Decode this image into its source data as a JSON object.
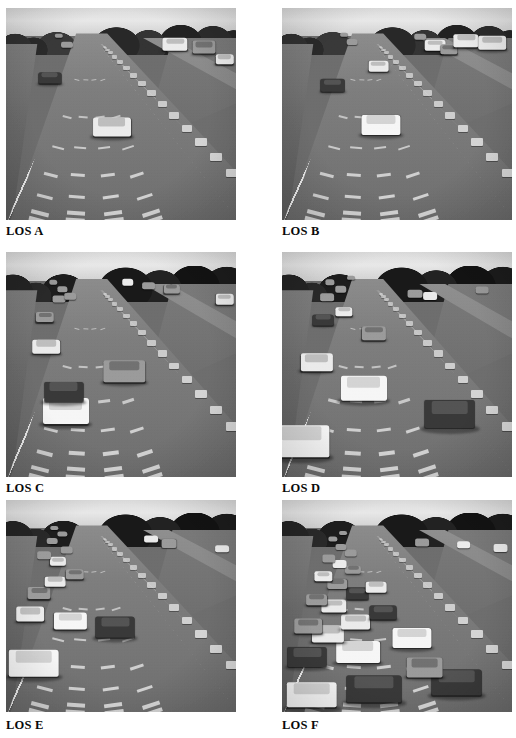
{
  "figure": {
    "layout": {
      "columns": 2,
      "rows": 3,
      "page_width": 516,
      "page_height": 738
    },
    "background_color": "#ffffff",
    "caption_color": "#0a0a0a"
  },
  "panels": [
    {
      "id": "los-a",
      "caption": "LOS A",
      "position": {
        "x": 6,
        "y": 8,
        "width": 230,
        "height": 212
      },
      "caption_position": {
        "x": 6,
        "y": 224
      },
      "scene": "four-lane freeway viewed from overpass, free-flow traffic",
      "density_label": "free flow",
      "vehicle_count": 7,
      "vehicles": [
        {
          "lane": 3,
          "x": 46.0,
          "y": 56.0,
          "w": 16.5,
          "h": 9.0,
          "tone": "light",
          "far": false
        },
        {
          "lane": 2,
          "x": 19.0,
          "y": 33.0,
          "w": 10.0,
          "h": 5.4,
          "tone": "dark",
          "far": false
        },
        {
          "lane": 2,
          "x": 26.5,
          "y": 17.5,
          "w": 5.2,
          "h": 3.0,
          "tone": "mid",
          "far": true
        },
        {
          "lane": 2,
          "x": 23.0,
          "y": 13.0,
          "w": 3.6,
          "h": 2.2,
          "tone": "mid",
          "far": true
        },
        {
          "lane": 9,
          "x": 73.5,
          "y": 17.0,
          "w": 11.0,
          "h": 6.0,
          "tone": "light",
          "far": false
        },
        {
          "lane": 9,
          "x": 86.0,
          "y": 18.5,
          "w": 10.0,
          "h": 6.2,
          "tone": "mid",
          "far": false
        },
        {
          "lane": 9,
          "x": 95.0,
          "y": 24.0,
          "w": 8.0,
          "h": 4.6,
          "tone": "light",
          "far": false
        }
      ]
    },
    {
      "id": "los-b",
      "caption": "LOS B",
      "position": {
        "x": 282,
        "y": 8,
        "width": 230,
        "height": 212
      },
      "caption_position": {
        "x": 282,
        "y": 224
      },
      "scene": "four-lane freeway, reasonably free flow",
      "density_label": "reasonably free flow",
      "vehicle_count": 10,
      "vehicles": [
        {
          "lane": 3,
          "x": 43.0,
          "y": 55.0,
          "w": 17.0,
          "h": 9.5,
          "tone": "white",
          "far": false
        },
        {
          "lane": 3,
          "x": 42.0,
          "y": 27.5,
          "w": 9.0,
          "h": 5.0,
          "tone": "light",
          "far": false
        },
        {
          "lane": 1,
          "x": 22.0,
          "y": 36.5,
          "w": 10.5,
          "h": 5.8,
          "tone": "dark",
          "far": false
        },
        {
          "lane": 2,
          "x": 30.5,
          "y": 16.0,
          "w": 4.6,
          "h": 2.8,
          "tone": "mid",
          "far": true
        },
        {
          "lane": 2,
          "x": 27.0,
          "y": 12.5,
          "w": 3.4,
          "h": 2.2,
          "tone": "mid",
          "far": true
        },
        {
          "lane": 8,
          "x": 66.5,
          "y": 17.5,
          "w": 9.0,
          "h": 5.0,
          "tone": "light",
          "far": false
        },
        {
          "lane": 9,
          "x": 72.5,
          "y": 19.5,
          "w": 7.5,
          "h": 4.4,
          "tone": "mid",
          "far": false
        },
        {
          "lane": 9,
          "x": 80.0,
          "y": 15.5,
          "w": 11.0,
          "h": 6.4,
          "tone": "light",
          "far": false
        },
        {
          "lane": 9,
          "x": 91.5,
          "y": 16.5,
          "w": 12.0,
          "h": 6.8,
          "tone": "light",
          "far": false
        },
        {
          "lane": 9,
          "x": 60.0,
          "y": 13.5,
          "w": 5.0,
          "h": 3.0,
          "tone": "mid",
          "far": true
        }
      ]
    },
    {
      "id": "los-c",
      "caption": "LOS C",
      "position": {
        "x": 6,
        "y": 252,
        "width": 230,
        "height": 225
      },
      "caption_position": {
        "x": 6,
        "y": 481
      },
      "scene": "four-lane freeway, stable flow with restricted maneuvering",
      "density_label": "stable flow",
      "vehicle_count": 13,
      "vehicles": [
        {
          "lane": 2,
          "x": 26.0,
          "y": 70.5,
          "w": 20.0,
          "h": 11.5,
          "tone": "white",
          "far": false
        },
        {
          "lane": 2,
          "x": 25.0,
          "y": 62.0,
          "w": 17.0,
          "h": 9.0,
          "tone": "dark",
          "far": false
        },
        {
          "lane": 5,
          "x": 51.5,
          "y": 53.0,
          "w": 18.0,
          "h": 9.5,
          "tone": "mid",
          "far": false
        },
        {
          "lane": 1,
          "x": 17.5,
          "y": 42.0,
          "w": 12.0,
          "h": 6.5,
          "tone": "light",
          "far": false
        },
        {
          "lane": 1,
          "x": 17.0,
          "y": 29.0,
          "w": 8.0,
          "h": 4.4,
          "tone": "mid",
          "far": false
        },
        {
          "lane": 2,
          "x": 23.0,
          "y": 21.0,
          "w": 5.6,
          "h": 3.2,
          "tone": "mid",
          "far": true
        },
        {
          "lane": 2,
          "x": 28.0,
          "y": 19.5,
          "w": 5.0,
          "h": 3.0,
          "tone": "mid",
          "far": true
        },
        {
          "lane": 2,
          "x": 24.5,
          "y": 16.5,
          "w": 4.0,
          "h": 2.4,
          "tone": "mid",
          "far": true
        },
        {
          "lane": 2,
          "x": 20.5,
          "y": 13.5,
          "w": 3.2,
          "h": 2.0,
          "tone": "mid",
          "far": true
        },
        {
          "lane": 8,
          "x": 53.0,
          "y": 13.5,
          "w": 5.0,
          "h": 3.0,
          "tone": "light",
          "far": true
        },
        {
          "lane": 9,
          "x": 62.0,
          "y": 15.0,
          "w": 6.0,
          "h": 3.4,
          "tone": "mid",
          "far": true
        },
        {
          "lane": 9,
          "x": 72.0,
          "y": 16.5,
          "w": 7.0,
          "h": 4.0,
          "tone": "mid",
          "far": false
        },
        {
          "lane": 9,
          "x": 95.0,
          "y": 21.0,
          "w": 8.0,
          "h": 4.6,
          "tone": "light",
          "far": false
        }
      ]
    },
    {
      "id": "los-d",
      "caption": "LOS D",
      "position": {
        "x": 282,
        "y": 252,
        "width": 230,
        "height": 225
      },
      "caption_position": {
        "x": 282,
        "y": 481
      },
      "scene": "four-lane freeway, approaching unstable flow",
      "density_label": "approaching unstable flow",
      "vehicle_count": 14,
      "vehicles": [
        {
          "lane": 1,
          "x": 8.5,
          "y": 84.0,
          "w": 24.0,
          "h": 14.0,
          "tone": "white",
          "far": false
        },
        {
          "lane": 6,
          "x": 73.0,
          "y": 72.0,
          "w": 22.0,
          "h": 12.5,
          "tone": "dark",
          "far": false
        },
        {
          "lane": 3,
          "x": 35.5,
          "y": 60.5,
          "w": 20.0,
          "h": 11.0,
          "tone": "white",
          "far": false
        },
        {
          "lane": 1,
          "x": 15.0,
          "y": 49.0,
          "w": 14.0,
          "h": 7.8,
          "tone": "light",
          "far": false
        },
        {
          "lane": 4,
          "x": 40.0,
          "y": 36.0,
          "w": 10.5,
          "h": 6.0,
          "tone": "mid",
          "far": false
        },
        {
          "lane": 2,
          "x": 18.0,
          "y": 30.0,
          "w": 9.0,
          "h": 5.0,
          "tone": "dark",
          "far": false
        },
        {
          "lane": 2,
          "x": 27.0,
          "y": 26.5,
          "w": 7.5,
          "h": 4.2,
          "tone": "light",
          "far": false
        },
        {
          "lane": 1,
          "x": 19.5,
          "y": 20.0,
          "w": 6.0,
          "h": 3.4,
          "tone": "mid",
          "far": true
        },
        {
          "lane": 2,
          "x": 25.5,
          "y": 16.5,
          "w": 5.0,
          "h": 3.0,
          "tone": "mid",
          "far": true
        },
        {
          "lane": 2,
          "x": 21.0,
          "y": 13.5,
          "w": 4.0,
          "h": 2.4,
          "tone": "mid",
          "far": true
        },
        {
          "lane": 2,
          "x": 30.0,
          "y": 11.5,
          "w": 3.4,
          "h": 2.0,
          "tone": "mid",
          "far": true
        },
        {
          "lane": 8,
          "x": 58.0,
          "y": 18.5,
          "w": 6.5,
          "h": 3.8,
          "tone": "mid",
          "far": true
        },
        {
          "lane": 9,
          "x": 64.5,
          "y": 19.5,
          "w": 6.0,
          "h": 3.6,
          "tone": "light",
          "far": true
        },
        {
          "lane": 9,
          "x": 87.0,
          "y": 17.0,
          "w": 5.5,
          "h": 3.2,
          "tone": "mid",
          "far": true
        }
      ]
    },
    {
      "id": "los-e",
      "caption": "LOS E",
      "position": {
        "x": 6,
        "y": 500,
        "width": 230,
        "height": 212
      },
      "caption_position": {
        "x": 6,
        "y": 718
      },
      "scene": "four-lane freeway at capacity, unstable flow",
      "density_label": "at capacity",
      "vehicle_count": 16,
      "vehicles": [
        {
          "lane": 1,
          "x": 12.0,
          "y": 77.0,
          "w": 22.0,
          "h": 12.5,
          "tone": "white",
          "far": false
        },
        {
          "lane": 4,
          "x": 47.5,
          "y": 60.0,
          "w": 17.0,
          "h": 10.0,
          "tone": "dark",
          "far": false
        },
        {
          "lane": 3,
          "x": 28.0,
          "y": 57.0,
          "w": 14.0,
          "h": 8.0,
          "tone": "white",
          "far": false
        },
        {
          "lane": 1,
          "x": 10.5,
          "y": 54.0,
          "w": 12.0,
          "h": 7.0,
          "tone": "light",
          "far": false
        },
        {
          "lane": 1,
          "x": 14.5,
          "y": 44.0,
          "w": 10.0,
          "h": 5.6,
          "tone": "mid",
          "far": false
        },
        {
          "lane": 2,
          "x": 21.5,
          "y": 38.5,
          "w": 9.0,
          "h": 5.0,
          "tone": "light",
          "far": false
        },
        {
          "lane": 3,
          "x": 30.0,
          "y": 35.0,
          "w": 8.0,
          "h": 4.6,
          "tone": "mid",
          "far": false
        },
        {
          "lane": 2,
          "x": 22.5,
          "y": 29.0,
          "w": 7.0,
          "h": 4.0,
          "tone": "light",
          "far": false
        },
        {
          "lane": 1,
          "x": 16.5,
          "y": 26.0,
          "w": 6.0,
          "h": 3.6,
          "tone": "mid",
          "far": true
        },
        {
          "lane": 2,
          "x": 26.5,
          "y": 23.5,
          "w": 5.4,
          "h": 3.2,
          "tone": "mid",
          "far": true
        },
        {
          "lane": 2,
          "x": 20.0,
          "y": 19.5,
          "w": 4.6,
          "h": 2.8,
          "tone": "mid",
          "far": true
        },
        {
          "lane": 2,
          "x": 24.5,
          "y": 16.0,
          "w": 4.0,
          "h": 2.4,
          "tone": "mid",
          "far": true
        },
        {
          "lane": 2,
          "x": 21.0,
          "y": 13.0,
          "w": 3.2,
          "h": 2.0,
          "tone": "mid",
          "far": true
        },
        {
          "lane": 8,
          "x": 63.0,
          "y": 18.5,
          "w": 6.0,
          "h": 3.4,
          "tone": "light",
          "far": true
        },
        {
          "lane": 9,
          "x": 71.0,
          "y": 20.5,
          "w": 6.5,
          "h": 3.8,
          "tone": "mid",
          "far": true
        },
        {
          "lane": 9,
          "x": 94.0,
          "y": 23.0,
          "w": 6.0,
          "h": 3.6,
          "tone": "light",
          "far": true
        }
      ]
    },
    {
      "id": "los-f",
      "caption": "LOS F",
      "position": {
        "x": 282,
        "y": 500,
        "width": 230,
        "height": 212
      },
      "caption_position": {
        "x": 282,
        "y": 718
      },
      "scene": "four-lane freeway, forced or breakdown flow with queued traffic",
      "density_label": "breakdown flow",
      "vehicle_count": 27,
      "vehicles": [
        {
          "lane": 1,
          "x": 13.0,
          "y": 92.0,
          "w": 22.0,
          "h": 12.0,
          "tone": "white",
          "far": false
        },
        {
          "lane": 3,
          "x": 40.0,
          "y": 89.0,
          "w": 24.0,
          "h": 13.0,
          "tone": "dark",
          "far": false
        },
        {
          "lane": 6,
          "x": 76.0,
          "y": 86.0,
          "w": 22.0,
          "h": 12.0,
          "tone": "dark",
          "far": false
        },
        {
          "lane": 5,
          "x": 62.0,
          "y": 79.0,
          "w": 16.0,
          "h": 9.0,
          "tone": "mid",
          "far": false
        },
        {
          "lane": 1,
          "x": 11.0,
          "y": 74.0,
          "w": 17.0,
          "h": 9.5,
          "tone": "dark",
          "far": false
        },
        {
          "lane": 3,
          "x": 33.0,
          "y": 71.5,
          "w": 19.0,
          "h": 10.5,
          "tone": "white",
          "far": false
        },
        {
          "lane": 5,
          "x": 56.5,
          "y": 65.0,
          "w": 17.0,
          "h": 9.5,
          "tone": "white",
          "far": false
        },
        {
          "lane": 2,
          "x": 20.0,
          "y": 63.0,
          "w": 14.0,
          "h": 8.0,
          "tone": "light",
          "far": false
        },
        {
          "lane": 1,
          "x": 11.5,
          "y": 59.5,
          "w": 12.0,
          "h": 7.0,
          "tone": "mid",
          "far": false
        },
        {
          "lane": 3,
          "x": 32.0,
          "y": 57.5,
          "w": 13.0,
          "h": 7.2,
          "tone": "light",
          "far": false
        },
        {
          "lane": 4,
          "x": 44.0,
          "y": 53.0,
          "w": 11.5,
          "h": 6.4,
          "tone": "dark",
          "far": false
        },
        {
          "lane": 2,
          "x": 22.5,
          "y": 50.0,
          "w": 11.0,
          "h": 6.2,
          "tone": "light",
          "far": false
        },
        {
          "lane": 1,
          "x": 15.0,
          "y": 47.0,
          "w": 9.5,
          "h": 5.4,
          "tone": "mid",
          "far": false
        },
        {
          "lane": 3,
          "x": 32.5,
          "y": 44.0,
          "w": 9.5,
          "h": 5.4,
          "tone": "dark",
          "far": false
        },
        {
          "lane": 4,
          "x": 41.0,
          "y": 41.0,
          "w": 9.0,
          "h": 5.0,
          "tone": "light",
          "far": false
        },
        {
          "lane": 2,
          "x": 24.0,
          "y": 39.5,
          "w": 8.5,
          "h": 4.8,
          "tone": "mid",
          "far": false
        },
        {
          "lane": 1,
          "x": 18.0,
          "y": 36.0,
          "w": 7.5,
          "h": 4.4,
          "tone": "light",
          "far": false
        },
        {
          "lane": 3,
          "x": 31.0,
          "y": 33.0,
          "w": 7.0,
          "h": 4.0,
          "tone": "mid",
          "far": false
        },
        {
          "lane": 2,
          "x": 25.0,
          "y": 30.0,
          "w": 6.4,
          "h": 3.8,
          "tone": "light",
          "far": true
        },
        {
          "lane": 1,
          "x": 20.5,
          "y": 27.5,
          "w": 5.8,
          "h": 3.4,
          "tone": "mid",
          "far": true
        },
        {
          "lane": 3,
          "x": 30.0,
          "y": 25.0,
          "w": 5.4,
          "h": 3.2,
          "tone": "mid",
          "far": true
        },
        {
          "lane": 2,
          "x": 25.5,
          "y": 22.0,
          "w": 4.8,
          "h": 2.8,
          "tone": "mid",
          "far": true
        },
        {
          "lane": 2,
          "x": 22.0,
          "y": 18.5,
          "w": 4.0,
          "h": 2.4,
          "tone": "mid",
          "far": true
        },
        {
          "lane": 2,
          "x": 26.5,
          "y": 15.5,
          "w": 3.4,
          "h": 2.0,
          "tone": "mid",
          "far": true
        },
        {
          "lane": 9,
          "x": 61.0,
          "y": 20.0,
          "w": 6.0,
          "h": 3.4,
          "tone": "mid",
          "far": true
        },
        {
          "lane": 9,
          "x": 79.0,
          "y": 21.0,
          "w": 6.0,
          "h": 3.6,
          "tone": "light",
          "far": true
        },
        {
          "lane": 9,
          "x": 95.0,
          "y": 22.5,
          "w": 6.5,
          "h": 3.8,
          "tone": "light",
          "far": true
        }
      ]
    }
  ]
}
